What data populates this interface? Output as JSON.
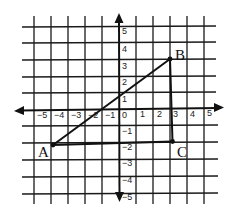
{
  "figure": {
    "type": "coordinate-plane",
    "x_range": [
      -5,
      5
    ],
    "y_range": [
      -5,
      5
    ],
    "x_tick_labels": [
      "-5",
      "-4",
      "-3",
      "-2",
      "-1",
      "0",
      "1",
      "2",
      "3",
      "4",
      "5"
    ],
    "y_tick_labels": [
      "5",
      "4",
      "3",
      "2",
      "1",
      "-1",
      "-2",
      "-3",
      "-4",
      "-5"
    ],
    "points": [
      {
        "label": "A",
        "x": -4,
        "y": -2
      },
      {
        "label": "B",
        "x": 3,
        "y": 3
      },
      {
        "label": "C",
        "x": 3,
        "y": -2
      }
    ],
    "segments": [
      {
        "from": "A",
        "to": "B"
      },
      {
        "from": "B",
        "to": "C"
      },
      {
        "from": "A",
        "to": "C"
      }
    ],
    "colors": {
      "line": "#111111",
      "grid": "#1a1a1a",
      "background": "#ffffff"
    }
  }
}
